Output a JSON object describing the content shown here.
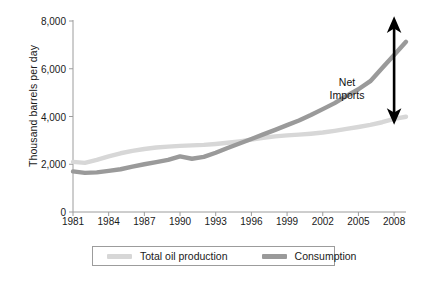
{
  "chart_data": {
    "type": "line",
    "title": "",
    "xlabel": "",
    "ylabel": "Thousand barrels per day",
    "xlim": [
      1981,
      2009
    ],
    "ylim": [
      0,
      8000
    ],
    "ytick_labels": [
      "0",
      "2,000",
      "4,000",
      "6,000",
      "8,000"
    ],
    "ytick_values": [
      0,
      2000,
      4000,
      6000,
      8000
    ],
    "xtick_labels": [
      "1981",
      "1984",
      "1987",
      "1990",
      "1993",
      "1996",
      "1999",
      "2002",
      "2005",
      "2008"
    ],
    "xtick_values": [
      1981,
      1984,
      1987,
      1990,
      1993,
      1996,
      1999,
      2002,
      2005,
      2008
    ],
    "grid": false,
    "legend_position": "bottom",
    "x": [
      1981,
      1982,
      1983,
      1984,
      1985,
      1986,
      1987,
      1988,
      1989,
      1990,
      1991,
      1992,
      1993,
      1994,
      1995,
      1996,
      1997,
      1998,
      1999,
      2000,
      2001,
      2002,
      2003,
      2004,
      2005,
      2006,
      2007,
      2008,
      2009
    ],
    "series": [
      {
        "name": "Total oil production",
        "color": "#d7d7d7",
        "values": [
          2100,
          2060,
          2180,
          2330,
          2460,
          2560,
          2640,
          2700,
          2740,
          2770,
          2790,
          2810,
          2850,
          2900,
          2960,
          3030,
          3110,
          3170,
          3210,
          3240,
          3280,
          3330,
          3400,
          3480,
          3560,
          3650,
          3760,
          3900,
          3990
        ]
      },
      {
        "name": "Consumption",
        "color": "#9a9a9a",
        "values": [
          1700,
          1640,
          1660,
          1720,
          1790,
          1900,
          2000,
          2090,
          2180,
          2330,
          2230,
          2310,
          2480,
          2680,
          2870,
          3060,
          3250,
          3440,
          3640,
          3830,
          4060,
          4310,
          4560,
          4860,
          5140,
          5480,
          6030,
          6580,
          7130
        ]
      }
    ],
    "annotations": [
      {
        "name": "net-imports",
        "text_line1": "Net",
        "text_line2": "Imports",
        "arrow": "double-headed-vertical",
        "color": "#000000",
        "at_x": 2008,
        "from_y": 4000,
        "to_y": 7850
      }
    ],
    "endpoint_values": {
      "production_2008": 4000,
      "consumption_2008": 7850,
      "crossover_year": 1993
    }
  },
  "axis": {
    "y_title": "Thousand barrels per day"
  },
  "legend": {
    "items": [
      {
        "label": "Total oil production",
        "color": "#d7d7d7"
      },
      {
        "label": "Consumption",
        "color": "#9a9a9a"
      }
    ]
  },
  "caption": {
    "text": ""
  }
}
